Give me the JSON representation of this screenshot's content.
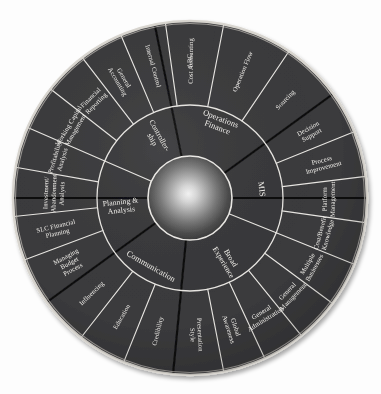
{
  "diagram": {
    "type": "radial-segmented-wheel",
    "center": {
      "x": 190,
      "y": 198
    },
    "radii": {
      "hub": 42,
      "inner_ring_outer": 93,
      "outer_ring_outer": 177
    },
    "colors": {
      "segment_fill": "#3a3a3c",
      "separator_thin": "#e8e6e2",
      "separator_quadrant": "#0b0b0c",
      "label_text": "#f2f0ec",
      "background": "#ffffff",
      "rim": "#d8d5cf"
    },
    "hub": {
      "name": "center-sphere",
      "style": "radial-gradient-sphere"
    },
    "quadrants": [
      {
        "id": "operations-finance",
        "inner_label": "Operations Finance",
        "inner_label_lines": [
          "Operations",
          "Finance"
        ],
        "start_deg": -90,
        "end_deg": 0,
        "outer_segments": [
          {
            "label": "Operation Flow",
            "lines": [
              "Operation Flow"
            ]
          },
          {
            "label": "Sourcing",
            "lines": [
              "Sourcing"
            ]
          }
        ]
      },
      {
        "id": "mis",
        "inner_label": "MIS",
        "inner_label_lines": [
          "MIS"
        ],
        "start_deg": 0,
        "end_deg": 90,
        "outer_segments": [
          {
            "label": "Decision Support",
            "lines": [
              "Decision",
              "Support"
            ]
          },
          {
            "label": "Process Improvement",
            "lines": [
              "Process",
              "Improvement"
            ]
          },
          {
            "label": "Platform Management",
            "lines": [
              "Platform",
              "Management"
            ]
          },
          {
            "label": "Cost/Benefit Knowledge",
            "lines": [
              "Cost/Benefit",
              "Knowledge"
            ]
          }
        ]
      },
      {
        "id": "broad-experience",
        "inner_label": "Broad Experience",
        "inner_label_lines": [
          "Broad",
          "Experience"
        ],
        "start_deg": 90,
        "end_deg": 180,
        "outer_segments": [
          {
            "label": "Multiple Businesses",
            "lines": [
              "Multiple",
              "Businesses"
            ]
          },
          {
            "label": "General Management",
            "lines": [
              "General",
              "Management"
            ]
          },
          {
            "label": "General Administration",
            "lines": [
              "General",
              "Administration"
            ]
          },
          {
            "label": "Global Awareness",
            "lines": [
              "Global",
              "Awareness"
            ]
          },
          {
            "label": "Presentation Style",
            "lines": [
              "Presentation",
              "Style"
            ]
          }
        ]
      },
      {
        "id": "communication",
        "inner_label": "Communication",
        "inner_label_lines": [
          "Communication"
        ],
        "start_deg": 180,
        "end_deg": 270,
        "outer_segments": [
          {
            "label": "Credibility",
            "lines": [
              "Credibility"
            ]
          },
          {
            "label": "Education",
            "lines": [
              "Education"
            ]
          },
          {
            "label": "Influencing",
            "lines": [
              "Influencing"
            ]
          }
        ]
      },
      {
        "id": "planning-analysis",
        "inner_label": "Planning & Analysis",
        "inner_label_lines": [
          "Planning &",
          "Analysis"
        ],
        "start_deg": 180,
        "end_deg": 270,
        "outer_segments": [
          {
            "label": "Managing Budget Process",
            "lines": [
              "Managing",
              "Budget",
              "Process"
            ]
          },
          {
            "label": "SLC Financial Planning",
            "lines": [
              "SLC Financial",
              "Planning"
            ]
          },
          {
            "label": "Investment/Abandonment Analysis",
            "lines": [
              "Investment/",
              "Abandonment",
              "Analysis"
            ]
          },
          {
            "label": "Profitability Analysis",
            "lines": [
              "Profitability",
              "Analysis"
            ]
          }
        ]
      },
      {
        "id": "controllership",
        "inner_label": "Controller-ship",
        "inner_label_lines": [
          "Controller-",
          "ship"
        ],
        "start_deg": 270,
        "end_deg": 360,
        "outer_segments": [
          {
            "label": "Working Capital Management",
            "lines": [
              "Working Capital",
              "Management"
            ]
          },
          {
            "label": "Financial Reporting",
            "lines": [
              "Financial",
              "Reporting"
            ]
          },
          {
            "label": "General Accounting",
            "lines": [
              "General",
              "Accounting"
            ]
          },
          {
            "label": "Internal Control",
            "lines": [
              "Internal Control"
            ]
          },
          {
            "label": "Cost Accounting",
            "lines": [
              "Cost Accounting"
            ]
          },
          {
            "label": "ABC",
            "lines": [
              "ABC"
            ]
          }
        ]
      }
    ],
    "outer_ring_order": [
      "ABC",
      "Operation Flow",
      "Sourcing",
      "Decision Support",
      "Process Improvement",
      "Platform Management",
      "Cost/Benefit Knowledge",
      "Multiple Businesses",
      "General Management",
      "General Administration",
      "Global Awareness",
      "Presentation Style",
      "Credibility",
      "Education",
      "Influencing",
      "Managing Budget Process",
      "SLC Financial Planning",
      "Investment/Abandonment Analysis",
      "Profitability Analysis",
      "Working Capital Management",
      "Financial Reporting",
      "General Accounting",
      "Internal Control",
      "Cost Accounting"
    ],
    "inner_ring_order": [
      "Operations Finance",
      "MIS",
      "Broad Experience",
      "Communication",
      "Planning & Analysis",
      "Controller-ship"
    ]
  }
}
